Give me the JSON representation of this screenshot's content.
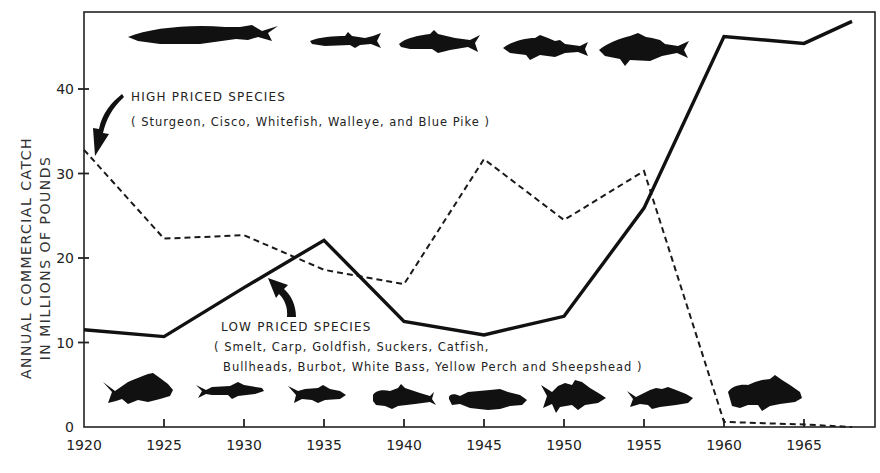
{
  "chart_data": {
    "type": "line",
    "title": "",
    "xlabel": "",
    "ylabel": "ANNUAL COMMERCIAL CATCH IN MILLIONS OF POUNDS",
    "ylabel_lines": [
      "ANNUAL COMMERCIAL CATCH",
      "IN MILLIONS OF POUNDS"
    ],
    "x": [
      1920,
      1925,
      1930,
      1935,
      1940,
      1945,
      1950,
      1955,
      1960,
      1965,
      1968
    ],
    "xticks": [
      "1920",
      "1925",
      "1930",
      "1935",
      "1940",
      "1945",
      "1950",
      "1955",
      "1960",
      "1965"
    ],
    "yticks": [
      "0",
      "10",
      "20",
      "30",
      "40"
    ],
    "xlim": [
      1920,
      1968
    ],
    "ylim": [
      0,
      49
    ],
    "grid": false,
    "legend_position": "inline annotations with arrows",
    "series": [
      {
        "name": "HIGH PRICED SPECIES",
        "members": "( Sturgeon, Cisco, Whitefish, Walleye, and Blue Pike )",
        "style": "dashed",
        "values": [
          32.8,
          22.3,
          22.7,
          18.6,
          16.9,
          31.7,
          24.5,
          30.3,
          0.6,
          0.3,
          0.0
        ]
      },
      {
        "name": "LOW PRICED SPECIES",
        "members_line1": "( Smelt, Carp, Goldfish, Suckers, Catfish,",
        "members_line2": "Bullheads, Burbot, White Bass, Yellow Perch and Sheepshead )",
        "style": "solid",
        "values": [
          11.5,
          10.7,
          16.5,
          22.1,
          12.5,
          10.9,
          13.1,
          25.9,
          46.2,
          45.4,
          48.0
        ]
      }
    ],
    "annotations": [
      {
        "text": "HIGH PRICED SPECIES",
        "arrow_to": "high-priced line at 1920"
      },
      {
        "text": "LOW PRICED SPECIES",
        "arrow_to": "low-priced line near 1932"
      }
    ],
    "decorations": {
      "top_fish_silhouettes": [
        "sturgeon",
        "cisco",
        "whitefish",
        "walleye",
        "blue pike"
      ],
      "bottom_fish_silhouettes": [
        "carp",
        "smelt",
        "sucker",
        "catfish",
        "burbot",
        "white bass",
        "yellow perch",
        "sheepshead"
      ]
    }
  },
  "labels": {
    "high_title": "HIGH PRICED SPECIES",
    "high_members": "( Sturgeon, Cisco, Whitefish, Walleye, and Blue Pike )",
    "low_title": "LOW PRICED SPECIES",
    "low_members_1": "( Smelt, Carp, Goldfish, Suckers, Catfish,",
    "low_members_2": "Bullheads, Burbot, White Bass, Yellow Perch and Sheepshead )",
    "ylabel_1": "ANNUAL COMMERCIAL CATCH",
    "ylabel_2": "IN MILLIONS OF POUNDS"
  }
}
